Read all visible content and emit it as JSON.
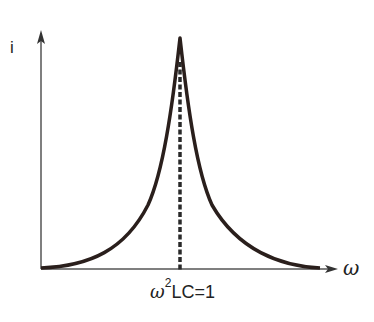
{
  "diagram": {
    "type": "resonance-curve",
    "y_axis_label": "i",
    "x_axis_label": "ω",
    "resonance_label": {
      "symbol": "ω",
      "exponent": "2",
      "rest": "LC=1"
    },
    "peak_marker": "dashed vertical line at resonance",
    "colors": {
      "curve": "#2a1f1c",
      "axes": "#555555",
      "background": "#ffffff"
    }
  }
}
